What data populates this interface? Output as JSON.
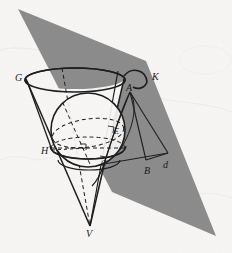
{
  "figure": {
    "width": 232,
    "height": 253,
    "background_color": "#f7f6f4",
    "plane_color": "#8a8a8a",
    "line_color": "#1a1a1a"
  },
  "labels": {
    "G": {
      "text": "G",
      "x": 15,
      "y": 73
    },
    "K": {
      "text": "K",
      "x": 152,
      "y": 72
    },
    "A": {
      "text": "A",
      "x": 126,
      "y": 83
    },
    "H": {
      "text": "H",
      "x": 41,
      "y": 146
    },
    "E": {
      "text": "E",
      "x": 114,
      "y": 128
    },
    "C": {
      "text": "C",
      "x": 101,
      "y": 160
    },
    "B": {
      "text": "B",
      "x": 144,
      "y": 166
    },
    "d": {
      "text": "d",
      "x": 163,
      "y": 160
    },
    "V": {
      "text": "V",
      "x": 86,
      "y": 229
    }
  },
  "geometry": {
    "cone": {
      "apex": {
        "x": 90,
        "y": 226
      },
      "rim_center": {
        "x": 75,
        "y": 80
      },
      "rim_rx": 50,
      "rim_ry": 12,
      "left_generator_label": "G",
      "right_generator_label": "K"
    },
    "sphere": {
      "center": {
        "x": 88,
        "y": 130
      },
      "radius": 37,
      "equator_ry": 11
    },
    "cutting_plane": {
      "vertices": [
        {
          "x": 18,
          "y": 9
        },
        {
          "x": 146,
          "y": 61
        },
        {
          "x": 216,
          "y": 236
        },
        {
          "x": 112,
          "y": 192
        }
      ],
      "color": "#8a8a8a"
    },
    "points": {
      "A": {
        "x": 130,
        "y": 92
      },
      "B": {
        "x": 146,
        "y": 160
      },
      "d": {
        "x": 168,
        "y": 153
      },
      "C": {
        "x": 104,
        "y": 164
      },
      "E": {
        "x": 115,
        "y": 135
      },
      "H": {
        "x": 52,
        "y": 152
      },
      "G": {
        "x": 27,
        "y": 80
      },
      "K": {
        "x": 124,
        "y": 80
      },
      "V": {
        "x": 90,
        "y": 226
      }
    },
    "right_angle_marks": [
      {
        "x": 84,
        "y": 148
      },
      {
        "x": 105,
        "y": 160
      },
      {
        "x": 112,
        "y": 131
      }
    ],
    "arc_K": {
      "from": {
        "x": 125,
        "y": 75
      },
      "to": {
        "x": 150,
        "y": 86
      },
      "description": "small arc above point A near label K"
    }
  }
}
